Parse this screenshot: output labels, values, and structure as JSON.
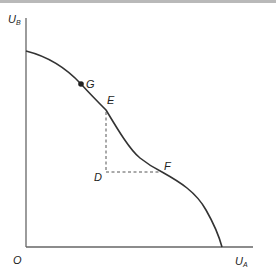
{
  "diagram": {
    "type": "utility-possibility-frontier",
    "axes": {
      "y_label": "U",
      "y_label_sub": "B",
      "x_label": "U",
      "x_label_sub": "A",
      "origin_label": "O"
    },
    "points": {
      "G": "G",
      "E": "E",
      "D": "D",
      "F": "F"
    },
    "colors": {
      "curve": "#333333",
      "axis": "#555555",
      "dashed": "#555555",
      "point": "#222222"
    }
  }
}
